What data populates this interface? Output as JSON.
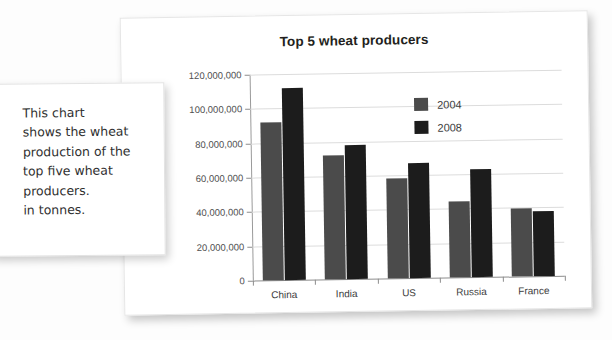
{
  "note": {
    "text": "This chart\nshows the wheat\nproduction of the\ntop five wheat\nproducers.\nin tonnes."
  },
  "colors": {
    "series_2004": "#4b4b4b",
    "series_2008": "#1c1c1c",
    "gridline": "#dcdcdc",
    "axis": "#8c8c8c",
    "card_background": "#ffffff",
    "page_background": "#fdfdfd",
    "title_text": "#231f20"
  },
  "chart_data": {
    "type": "bar",
    "title": "Top 5 wheat producers",
    "xlabel": "",
    "ylabel": "",
    "categories": [
      "China",
      "India",
      "US",
      "Russia",
      "France"
    ],
    "series": [
      {
        "name": "2004",
        "color": "#4b4b4b",
        "values": [
          92000000,
          72000000,
          58500000,
          44500000,
          39500000
        ]
      },
      {
        "name": "2008",
        "color": "#1c1c1c",
        "values": [
          112000000,
          78000000,
          67000000,
          63000000,
          38000000
        ]
      }
    ],
    "ylim": [
      0,
      120000000
    ],
    "ytick_values": [
      0,
      20000000,
      40000000,
      60000000,
      80000000,
      100000000,
      120000000
    ],
    "ytick_labels": [
      "0",
      "20,000,000",
      "40,000,000",
      "60,000,000",
      "80,000,000",
      "100,000,000",
      "120,000,000"
    ],
    "grid": true,
    "legend_position": "upper right",
    "legend_entries": [
      "2004",
      "2008"
    ]
  }
}
